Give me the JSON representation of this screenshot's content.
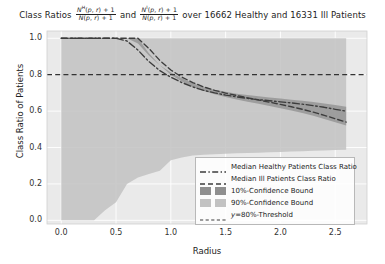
{
  "chart_data": {
    "type": "line",
    "title_prefix": "Class Ratios",
    "title_middle": "and",
    "title_suffix": "over 16662 Healthy and 16331 Ill Patients",
    "formula_healthy": {
      "numerator_base": "N",
      "numerator_sup": "H",
      "numerator_args": "(p, r) + 1",
      "denominator_base": "N",
      "denominator_args": "(p, r) + 1"
    },
    "formula_ill": {
      "numerator_base": "N",
      "numerator_sup": "I",
      "numerator_args": "(p, r) + 1",
      "denominator_base": "N",
      "denominator_args": "(p, r) + 1"
    },
    "counts": {
      "healthy_patients": 16662,
      "ill_patients": 16331
    },
    "xlabel": "Radius",
    "ylabel": "Class Ratio of Patients",
    "xlim": [
      -0.13,
      2.79
    ],
    "ylim": [
      -0.02,
      1.04
    ],
    "xticks": [
      0.0,
      0.5,
      1.0,
      1.5,
      2.0,
      2.5
    ],
    "xticklabels": [
      "0.0",
      "0.5",
      "1.0",
      "1.5",
      "2.0",
      "2.5"
    ],
    "yticks": [
      0.0,
      0.2,
      0.4,
      0.6,
      0.8,
      1.0
    ],
    "yticklabels": [
      "0.0",
      "0.2",
      "0.4",
      "0.6",
      "0.8",
      "1.0"
    ],
    "grid": true,
    "legend_position": "lower right",
    "threshold": 0.8,
    "x": [
      0.0,
      0.1,
      0.2,
      0.3,
      0.4,
      0.5,
      0.6,
      0.7,
      0.8,
      0.9,
      1.0,
      1.1,
      1.2,
      1.3,
      1.4,
      1.5,
      1.6,
      1.7,
      1.8,
      1.9,
      2.0,
      2.1,
      2.2,
      2.3,
      2.4,
      2.5,
      2.6
    ],
    "series": [
      {
        "name": "Median Healthy Patients Class Ratio",
        "style": "dashdot",
        "color": "#3f3f3f",
        "values": [
          1.0,
          1.0,
          1.0,
          1.0,
          1.0,
          1.0,
          0.985,
          0.935,
          0.872,
          0.822,
          0.786,
          0.757,
          0.733,
          0.714,
          0.7,
          0.688,
          0.678,
          0.67,
          0.663,
          0.657,
          0.651,
          0.645,
          0.638,
          0.63,
          0.621,
          0.61,
          0.6
        ]
      },
      {
        "name": "Median Ill Patients Class Ratio",
        "style": "dashed",
        "color": "#3f3f3f",
        "values": [
          1.0,
          1.0,
          1.0,
          1.0,
          1.0,
          1.0,
          1.0,
          1.0,
          0.944,
          0.878,
          0.826,
          0.787,
          0.757,
          0.733,
          0.714,
          0.699,
          0.686,
          0.673,
          0.661,
          0.649,
          0.637,
          0.624,
          0.61,
          0.594,
          0.577,
          0.558,
          0.54
        ]
      }
    ],
    "bands": [
      {
        "name": "10%-Confidence Bound",
        "fill": "#9a9a9a",
        "alpha": 0.55,
        "upper": [
          1.0,
          1.0,
          1.0,
          1.0,
          1.0,
          1.0,
          1.0,
          0.972,
          0.905,
          0.852,
          0.812,
          0.78,
          0.754,
          0.734,
          0.718,
          0.706,
          0.696,
          0.688,
          0.681,
          0.675,
          0.669,
          0.663,
          0.657,
          0.65,
          0.642,
          0.633,
          0.624
        ],
        "lower": [
          1.0,
          1.0,
          1.0,
          1.0,
          1.0,
          1.0,
          1.0,
          1.0,
          0.918,
          0.852,
          0.8,
          0.762,
          0.733,
          0.71,
          0.692,
          0.677,
          0.664,
          0.652,
          0.64,
          0.628,
          0.616,
          0.603,
          0.589,
          0.574,
          0.557,
          0.539,
          0.521
        ]
      },
      {
        "name": "90%-Confidence Bound",
        "fill": "#b9b9b9",
        "alpha": 0.45,
        "upper": [
          1.0,
          1.0,
          1.0,
          1.0,
          1.0,
          1.0,
          1.0,
          1.0,
          1.0,
          1.0,
          1.0,
          1.0,
          1.0,
          1.0,
          1.0,
          1.0,
          1.0,
          1.0,
          1.0,
          1.0,
          1.0,
          1.0,
          1.0,
          1.0,
          1.0,
          1.0,
          1.0
        ],
        "lower": [
          0.0,
          0.0,
          0.0,
          0.0,
          0.055,
          0.1,
          0.2,
          0.236,
          0.255,
          0.272,
          0.33,
          0.345,
          0.356,
          0.36,
          0.363,
          0.366,
          0.368,
          0.37,
          0.372,
          0.374,
          0.376,
          0.378,
          0.38,
          0.382,
          0.384,
          0.386,
          0.388
        ]
      }
    ]
  },
  "legend": {
    "items": [
      {
        "label": "Median Healthy Patients Class Ratio",
        "kind": "dashdot-line",
        "name": "legend-median-healthy"
      },
      {
        "label": "Median Ill Patients Class Ratio",
        "kind": "dashed-line",
        "name": "legend-median-ill"
      },
      {
        "label": "10%-Confidence Bound",
        "kind": "swatch-dark",
        "name": "legend-10-confidence"
      },
      {
        "label": "90%-Confidence Bound",
        "kind": "swatch-light",
        "name": "legend-90-confidence"
      },
      {
        "label": "y=80%-Threshold",
        "kind": "dashed-line-thin",
        "name": "legend-threshold"
      }
    ]
  },
  "colors": {
    "band_10": "#8f8f8f",
    "band_90": "#c2c2c2",
    "line": "#3c3c3c",
    "axes_bg": "#eaeaea",
    "grid": "#ffffff"
  }
}
